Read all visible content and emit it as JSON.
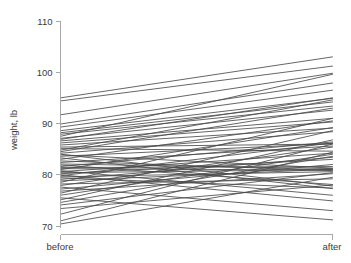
{
  "chart_data": {
    "type": "line",
    "title": "",
    "subtitle": "",
    "xlabel": "",
    "ylabel": "weight, lb",
    "categories": [
      "before",
      "after"
    ],
    "x_tick_labels": [
      "before",
      "after"
    ],
    "y_tick_labels": [
      "70",
      "80",
      "90",
      "100",
      "110"
    ],
    "y_ticks": [
      70,
      80,
      90,
      100,
      110
    ],
    "ylim": [
      69.0,
      111.5
    ],
    "grid": false,
    "legend": false,
    "legend_position": "none",
    "line_color": "#4a4a4a",
    "axis_color": "#a8a8a8",
    "background_color": "#ffffff",
    "n_series": 58,
    "series": [
      {
        "name": "subject-1",
        "values": [
          95.0,
          103.0
        ]
      },
      {
        "name": "subject-2",
        "values": [
          94.4,
          101.2
        ]
      },
      {
        "name": "subject-3",
        "values": [
          91.7,
          99.8
        ]
      },
      {
        "name": "subject-4",
        "values": [
          89.9,
          97.9
        ]
      },
      {
        "name": "subject-5",
        "values": [
          89.3,
          96.5
        ]
      },
      {
        "name": "subject-6",
        "values": [
          88.6,
          94.9
        ]
      },
      {
        "name": "subject-7",
        "values": [
          88.2,
          94.2
        ]
      },
      {
        "name": "subject-8",
        "values": [
          87.9,
          93.4
        ]
      },
      {
        "name": "subject-9",
        "values": [
          87.5,
          99.6
        ]
      },
      {
        "name": "subject-10",
        "values": [
          87.1,
          92.6
        ]
      },
      {
        "name": "subject-11",
        "values": [
          86.6,
          91.0
        ]
      },
      {
        "name": "subject-12",
        "values": [
          86.2,
          90.3
        ]
      },
      {
        "name": "subject-13",
        "values": [
          85.8,
          89.1
        ]
      },
      {
        "name": "subject-14",
        "values": [
          85.4,
          86.0
        ]
      },
      {
        "name": "subject-15",
        "values": [
          85.1,
          84.6
        ]
      },
      {
        "name": "subject-16",
        "values": [
          84.8,
          94.6
        ]
      },
      {
        "name": "subject-17",
        "values": [
          84.5,
          93.0
        ]
      },
      {
        "name": "subject-18",
        "values": [
          84.2,
          88.4
        ]
      },
      {
        "name": "subject-19",
        "values": [
          83.9,
          81.3
        ]
      },
      {
        "name": "subject-20",
        "values": [
          83.6,
          86.1
        ]
      },
      {
        "name": "subject-21",
        "values": [
          83.3,
          77.3
        ]
      },
      {
        "name": "subject-22",
        "values": [
          83.0,
          90.5
        ]
      },
      {
        "name": "subject-23",
        "values": [
          82.7,
          80.8
        ]
      },
      {
        "name": "subject-24",
        "values": [
          82.4,
          85.6
        ]
      },
      {
        "name": "subject-25",
        "values": [
          82.1,
          81.2
        ]
      },
      {
        "name": "subject-26",
        "values": [
          81.9,
          78.1
        ]
      },
      {
        "name": "subject-27",
        "values": [
          81.6,
          86.4
        ]
      },
      {
        "name": "subject-28",
        "values": [
          81.4,
          81.6
        ]
      },
      {
        "name": "subject-29",
        "values": [
          81.2,
          80.9
        ]
      },
      {
        "name": "subject-30",
        "values": [
          81.0,
          89.2
        ]
      },
      {
        "name": "subject-31",
        "values": [
          80.8,
          76.0
        ]
      },
      {
        "name": "subject-32",
        "values": [
          80.6,
          84.2
        ]
      },
      {
        "name": "subject-33",
        "values": [
          80.4,
          81.0
        ]
      },
      {
        "name": "subject-34",
        "values": [
          80.2,
          83.0
        ]
      },
      {
        "name": "subject-35",
        "values": [
          80.0,
          74.9
        ]
      },
      {
        "name": "subject-36",
        "values": [
          79.8,
          86.2
        ]
      },
      {
        "name": "subject-37",
        "values": [
          79.6,
          80.6
        ]
      },
      {
        "name": "subject-38",
        "values": [
          79.4,
          77.4
        ]
      },
      {
        "name": "subject-39",
        "values": [
          79.1,
          83.4
        ]
      },
      {
        "name": "subject-40",
        "values": [
          78.8,
          81.1
        ]
      },
      {
        "name": "subject-41",
        "values": [
          78.5,
          91.0
        ]
      },
      {
        "name": "subject-42",
        "values": [
          78.2,
          79.2
        ]
      },
      {
        "name": "subject-43",
        "values": [
          77.9,
          85.4
        ]
      },
      {
        "name": "subject-44",
        "values": [
          77.6,
          73.0
        ]
      },
      {
        "name": "subject-45",
        "values": [
          77.2,
          82.0
        ]
      },
      {
        "name": "subject-46",
        "values": [
          76.8,
          80.2
        ]
      },
      {
        "name": "subject-47",
        "values": [
          76.4,
          88.6
        ]
      },
      {
        "name": "subject-48",
        "values": [
          76.0,
          84.0
        ]
      },
      {
        "name": "subject-49",
        "values": [
          75.5,
          71.2
        ]
      },
      {
        "name": "subject-50",
        "values": [
          75.1,
          86.8
        ]
      },
      {
        "name": "subject-51",
        "values": [
          74.6,
          83.6
        ]
      },
      {
        "name": "subject-52",
        "values": [
          74.1,
          80.4
        ]
      },
      {
        "name": "subject-53",
        "values": [
          73.4,
          78.0
        ]
      },
      {
        "name": "subject-54",
        "values": [
          72.3,
          86.0
        ]
      },
      {
        "name": "subject-55",
        "values": [
          71.0,
          84.4
        ]
      },
      {
        "name": "subject-56",
        "values": [
          70.4,
          79.5
        ]
      },
      {
        "name": "subject-57",
        "values": [
          86.9,
          95.0
        ]
      },
      {
        "name": "subject-58",
        "values": [
          84.0,
          77.8
        ]
      }
    ]
  },
  "axes": {
    "y_title": "weight, lb",
    "x_left_label": "before",
    "x_right_label": "after"
  }
}
